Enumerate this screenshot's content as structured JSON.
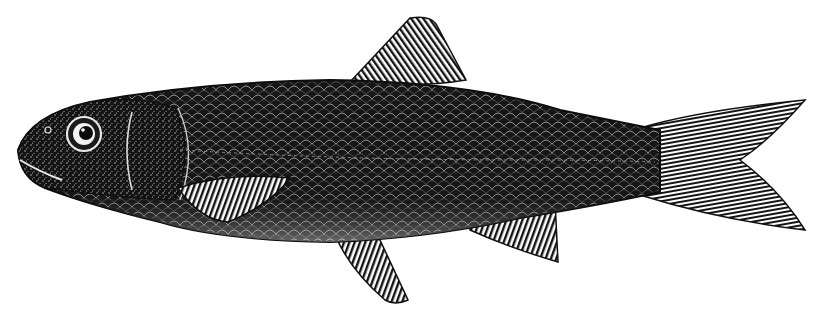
{
  "image": {
    "subject": "fish",
    "style": "black-and-white engraving",
    "background_color": "#ffffff",
    "ink_color": "#111111",
    "highlight_color": "#f2f2f2",
    "parts": [
      "body",
      "head",
      "eye",
      "gill-cover",
      "dorsal-fin",
      "pectoral-fin",
      "pelvic-fin",
      "anal-fin",
      "caudal-fin",
      "scales"
    ]
  }
}
